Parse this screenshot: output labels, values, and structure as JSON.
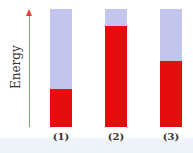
{
  "axis": {
    "label": "Energy",
    "arrow_color": "#e0403a"
  },
  "colors": {
    "empty": "#c3c5ec",
    "filled": "#e40e0e"
  },
  "bars": [
    {
      "label": "(1)",
      "fraction": 0.32
    },
    {
      "label": "(2)",
      "fraction": 0.86
    },
    {
      "label": "(3)",
      "fraction": 0.56
    }
  ],
  "chart_data": {
    "type": "bar",
    "categories": [
      "(1)",
      "(2)",
      "(3)"
    ],
    "values": [
      0.32,
      0.86,
      0.56
    ],
    "title": "",
    "xlabel": "",
    "ylabel": "Energy",
    "ylim": [
      0,
      1
    ]
  }
}
